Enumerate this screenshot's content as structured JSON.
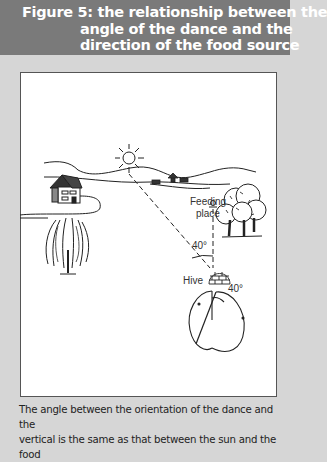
{
  "figure": {
    "title_line1": "Figure 5: the relationship between the",
    "title_line2": "angle of the dance and the",
    "title_line3": "direction of the food source"
  },
  "diagram": {
    "labels": {
      "feeding_place_1": "Feeding",
      "feeding_place_2": "place",
      "angle_top": "40°",
      "hive": "Hive",
      "angle_dance": "40°"
    },
    "elements": [
      "sun",
      "house",
      "tree-willow",
      "trees",
      "hive",
      "hills",
      "cattle",
      "dance-figure-eight"
    ]
  },
  "caption": {
    "line1": "The angle between the orientation of the dance and the",
    "line2": "vertical is the same as that between the sun and the food"
  },
  "colors": {
    "header_bg": "#7a7a7a",
    "page_bg": "#d6d6d6",
    "figure_bg": "#ffffff"
  }
}
